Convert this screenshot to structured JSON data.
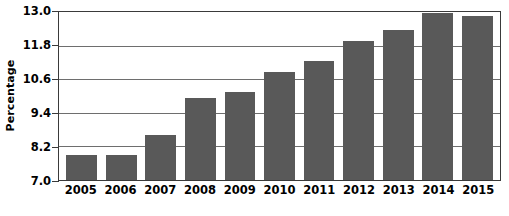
{
  "chart_data": {
    "type": "bar",
    "title": "",
    "xlabel": "",
    "ylabel": "Percentage",
    "categories": [
      "2005",
      "2006",
      "2007",
      "2008",
      "2009",
      "2010",
      "2011",
      "2012",
      "2013",
      "2014",
      "2015"
    ],
    "values": [
      7.9,
      7.9,
      8.6,
      9.9,
      10.1,
      10.8,
      11.2,
      11.9,
      12.3,
      12.9,
      12.8
    ],
    "series": [
      {
        "name": "Percentage",
        "values": [
          7.9,
          7.9,
          8.6,
          9.9,
          10.1,
          10.8,
          11.2,
          11.9,
          12.3,
          12.9,
          12.8
        ]
      }
    ],
    "ylim": [
      7.0,
      13.0
    ],
    "ytick_labels": [
      "13.0",
      "11.8",
      "10.6",
      "9.4",
      "8.2",
      "7.0"
    ],
    "ytick_values": [
      13.0,
      11.8,
      10.6,
      9.4,
      8.2,
      7.0
    ],
    "ytick_interval": 1.2,
    "grid": true,
    "grid_axis": "y",
    "legend": false,
    "legend_position": "none",
    "bar_color": "#595959",
    "gridline_color": "#6e6e6e",
    "axis_color": "#3a3a3a",
    "background_color": "#ffffff"
  }
}
